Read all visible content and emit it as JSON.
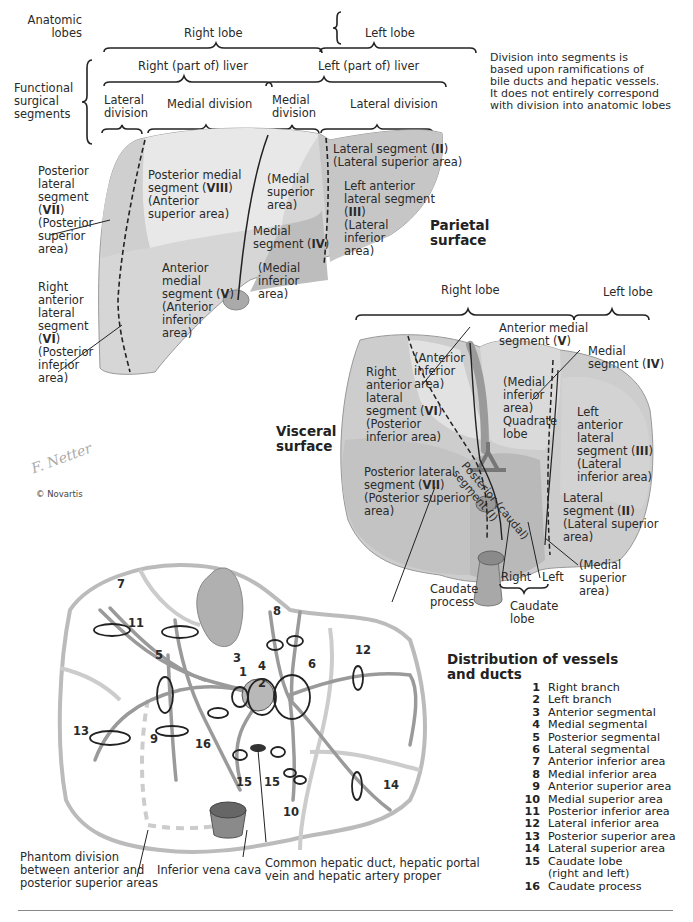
{
  "header": {
    "anatomic_lobes_label": "Anatomic\nlobes",
    "functional_label": "Functional\nsurgical\nsegments",
    "right_lobe": "Right lobe",
    "left_lobe": "Left lobe",
    "right_part_liver": "Right (part of) liver",
    "left_part_liver": "Left (part of) liver",
    "lateral_division_r": "Lateral\ndivision",
    "medial_division_r": "Medial division",
    "medial_division_l": "Medial\ndivision",
    "lateral_division_l": "Lateral division",
    "note": "Division into segments is\nbased upon ramifications of\nbile ducts and hepatic vessels.\nIt does not entirely correspond\nwith division into anatomic lobes"
  },
  "parietal": {
    "title": "Parietal\nsurface",
    "seg_vii_pre": "Posterior\nlateral\nsegment\n(",
    "seg_vii_num": "VII",
    "seg_vii_post": ")\n(Posterior\nsuperior\narea)",
    "seg_vi_pre": "Right\nanterior\nlateral\nsegment\n(",
    "seg_vi_num": "VI",
    "seg_vi_post": ")\n(Posterior\ninferior\narea)",
    "seg_viii_pre": "Posterior medial\nsegment (",
    "seg_viii_num": "VIII",
    "seg_viii_post": ")\n(Anterior\nsuperior area)",
    "seg_v_pre": "Anterior\nmedial\nsegment (",
    "seg_v_num": "V",
    "seg_v_post": ")\n(Anterior\ninferior\narea)",
    "med_sup": "(Medial\nsuperior\narea)",
    "seg_iv_pre": "Medial\nsegment (",
    "seg_iv_num": "IV",
    "seg_iv_post": ")",
    "med_inf": "(Medial\ninferior\narea)",
    "seg_ii_pre": "Lateral segment (",
    "seg_ii_num": "II",
    "seg_ii_post": ")\n(Lateral superior area)",
    "seg_iii_pre": "Left anterior\nlateral segment\n(",
    "seg_iii_num": "III",
    "seg_iii_post": ")\n(Lateral\ninferior\narea)"
  },
  "visceral": {
    "title": "Visceral\nsurface",
    "right_lobe": "Right lobe",
    "left_lobe": "Left lobe",
    "ant_medial_pre": "Anterior medial\nsegment (",
    "ant_medial_num": "V",
    "ant_medial_post": ")",
    "medial_seg_pre": "Medial\nsegment (",
    "medial_seg_num": "IV",
    "medial_seg_post": ")",
    "ant_inf": "(Anterior\ninferior\narea)",
    "seg_vi_pre": "Right\nanterior\nlateral\nsegment (",
    "seg_vi_num": "VI",
    "seg_vi_post": ")\n(Posterior\ninferior area)",
    "quadrate": "(Medial\ninferior\narea)\nQuadrate\nlobe",
    "seg_iii_pre": "Left\nanterior\nlateral\nsegment (",
    "seg_iii_num": "III",
    "seg_iii_post": ")\n(Lateral\ninferior area)",
    "seg_vii_pre": "Posterior lateral\nsegment (",
    "seg_vii_num": "VII",
    "seg_vii_post": ")\n(Posterior superior\n    area)",
    "seg_i": "Posterior (caudal)\nsegment (I)",
    "seg_ii_pre": "Lateral\nsegment (",
    "seg_ii_num": "II",
    "seg_ii_post": ")\n(Lateral superior\n     area)",
    "caudate_process": "Caudate\nprocess",
    "right": "Right",
    "left": "Left",
    "caudate_lobe": "Caudate\nlobe",
    "medial_superior": "(Medial\nsuperior\narea)"
  },
  "signature": {
    "copyright": "© Novartis"
  },
  "distribution": {
    "title": "Distribution of vessels\nand ducts",
    "numbers": {
      "n1": "1",
      "n2": "2",
      "n3": "3",
      "n4": "4",
      "n5": "5",
      "n6": "6",
      "n7": "7",
      "n8": "8",
      "n9": "9",
      "n10": "10",
      "n11": "11",
      "n12": "12",
      "n13": "13",
      "n14": "14",
      "n15a": "15",
      "n15b": "15",
      "n16": "16"
    },
    "phantom": "Phantom division\nbetween anterior and\nposterior superior areas",
    "ivc": "Inferior vena cava",
    "common": "Common hepatic duct, hepatic portal\nvein and hepatic artery proper",
    "legend": [
      {
        "num": "1",
        "label": "Right branch"
      },
      {
        "num": "2",
        "label": "Left branch"
      },
      {
        "num": "3",
        "label": "Anterior segmental"
      },
      {
        "num": "4",
        "label": "Medial segmental"
      },
      {
        "num": "5",
        "label": "Posterior segmental"
      },
      {
        "num": "6",
        "label": "Lateral segmental"
      },
      {
        "num": "7",
        "label": "Anterior inferior area"
      },
      {
        "num": "8",
        "label": "Medial inferior area"
      },
      {
        "num": "9",
        "label": "Anterior superior area"
      },
      {
        "num": "10",
        "label": "Medial superior area"
      },
      {
        "num": "11",
        "label": "Posterior inferior area"
      },
      {
        "num": "12",
        "label": "Lateral inferior area"
      },
      {
        "num": "13",
        "label": "Posterior superior area"
      },
      {
        "num": "14",
        "label": "Lateral superior area"
      },
      {
        "num": "15",
        "label": "Caudate lobe\n(right and left)"
      },
      {
        "num": "16",
        "label": "Caudate process"
      }
    ]
  },
  "colors": {
    "liver_light": "#e4e4e4",
    "liver_mid": "#c9c9c9",
    "liver_dark": "#b5b5b5",
    "line": "#222222"
  }
}
